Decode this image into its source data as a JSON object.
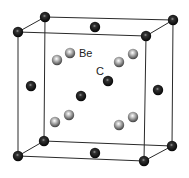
{
  "diagram": {
    "labels": {
      "be": {
        "text": "Be",
        "x": 79,
        "y": 57
      },
      "c": {
        "text": "C",
        "x": 96,
        "y": 75
      }
    },
    "colors": {
      "background": "#ffffff",
      "edge": "#2a2a2a",
      "carbon_atom": "#111111",
      "beryllium_atom": "#8a8a8a"
    },
    "cube_corners": {
      "back_top_left": [
        45,
        17
      ],
      "back_top_right": [
        173,
        20
      ],
      "back_bottom_left": [
        44,
        141
      ],
      "back_bottom_right": [
        172,
        146
      ],
      "front_top_left": [
        18,
        32
      ],
      "front_top_right": [
        146,
        36
      ],
      "front_bottom_left": [
        18,
        156
      ],
      "front_bottom_right": [
        144,
        161
      ]
    },
    "carbon_atoms": [
      {
        "name": "corner-back-top-left",
        "x": 45,
        "y": 17
      },
      {
        "name": "corner-back-top-right",
        "x": 173,
        "y": 20
      },
      {
        "name": "corner-back-bottom-left",
        "x": 44,
        "y": 141
      },
      {
        "name": "corner-back-bottom-right",
        "x": 172,
        "y": 146
      },
      {
        "name": "corner-front-top-left",
        "x": 18,
        "y": 32
      },
      {
        "name": "corner-front-top-right",
        "x": 146,
        "y": 36
      },
      {
        "name": "corner-front-bottom-left",
        "x": 18,
        "y": 156
      },
      {
        "name": "corner-front-bottom-right",
        "x": 144,
        "y": 161
      },
      {
        "name": "face-top",
        "x": 95,
        "y": 27
      },
      {
        "name": "face-bottom",
        "x": 95,
        "y": 153
      },
      {
        "name": "face-left",
        "x": 31,
        "y": 86
      },
      {
        "name": "face-right",
        "x": 158,
        "y": 90
      },
      {
        "name": "face-front",
        "x": 108,
        "y": 81
      },
      {
        "name": "face-back",
        "x": 81,
        "y": 96
      }
    ],
    "beryllium_atoms": [
      {
        "name": "be-upper-left-front",
        "x": 57,
        "y": 60
      },
      {
        "name": "be-upper-left-back",
        "x": 70,
        "y": 53
      },
      {
        "name": "be-upper-right-front",
        "x": 119,
        "y": 62
      },
      {
        "name": "be-upper-right-back",
        "x": 133,
        "y": 54
      },
      {
        "name": "be-lower-left-front",
        "x": 55,
        "y": 122
      },
      {
        "name": "be-lower-left-back",
        "x": 69,
        "y": 115
      },
      {
        "name": "be-lower-right-front",
        "x": 119,
        "y": 125
      },
      {
        "name": "be-lower-right-back",
        "x": 133,
        "y": 117
      }
    ]
  }
}
